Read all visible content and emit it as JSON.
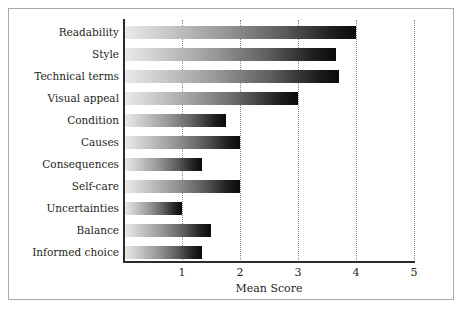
{
  "chart_data": {
    "type": "bar",
    "orientation": "horizontal",
    "title": "",
    "xlabel": "Mean Score",
    "ylabel": "",
    "xlim": [
      0,
      5
    ],
    "xticks": [
      1,
      2,
      3,
      4,
      5
    ],
    "xtick_labels": [
      "1",
      "2",
      "3",
      "4",
      "5"
    ],
    "grid": "vertical-dotted",
    "legend": "none",
    "categories": [
      "Readability",
      "Style",
      "Technical terms",
      "Visual appeal",
      "Condition",
      "Causes",
      "Consequences",
      "Self-care",
      "Uncertainties",
      "Balance",
      "Informed choice"
    ],
    "values": [
      4.0,
      3.65,
      3.7,
      3.0,
      1.75,
      2.0,
      1.35,
      2.0,
      1.0,
      1.5,
      1.35
    ],
    "bar_fill": "gradient-light-to-dark",
    "bar_color_start": "#ebebeb",
    "bar_color_end": "#0b0b0b",
    "axis_color": "#2b2b2b",
    "grid_color": "#8a8a8a",
    "text_color": "#231f20",
    "frame_color": "#a9a9a9",
    "background": "#ffffff"
  }
}
